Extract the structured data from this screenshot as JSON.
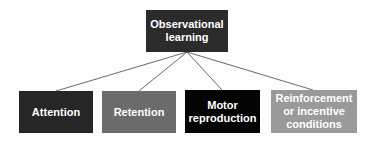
{
  "diagram": {
    "root": {
      "label_line1": "Observational",
      "label_line2": "learning",
      "color": "#2b2b2b"
    },
    "children": [
      {
        "label_line1": "Attention",
        "label_line2": "",
        "label_line3": "",
        "color": "#262626"
      },
      {
        "label_line1": "Retention",
        "label_line2": "",
        "label_line3": "",
        "color": "#6b6b6b"
      },
      {
        "label_line1": "Motor",
        "label_line2": "reproduction",
        "label_line3": "",
        "color": "#050505"
      },
      {
        "label_line1": "Reinforcement",
        "label_line2": "or incentive",
        "label_line3": "conditions",
        "color": "#9a9a9a"
      }
    ]
  }
}
